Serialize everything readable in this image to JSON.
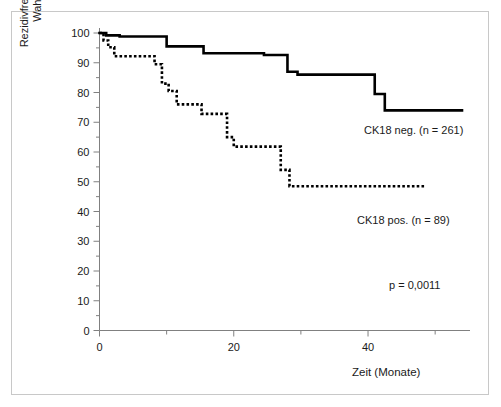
{
  "chart_data": {
    "type": "line",
    "subtype": "kaplan-meier-step",
    "title": "",
    "xlabel": "Zeit (Monate)",
    "ylabel": "Rezidivfreies Gesamtüberleben –\nWahrscheinlichkeit (%)",
    "xlim": [
      0,
      54
    ],
    "ylim": [
      0,
      100
    ],
    "grid": false,
    "legend_position": "inline-annotations",
    "x_ticks_major": [
      0,
      20,
      40
    ],
    "x_tick_labels": [
      "0",
      "20",
      "40"
    ],
    "x_ticks_minor": [
      10,
      30,
      50
    ],
    "y_ticks_major": [
      0,
      10,
      20,
      30,
      40,
      50,
      60,
      70,
      80,
      90,
      100
    ],
    "y_tick_labels": [
      "0",
      "10",
      "20",
      "30",
      "40",
      "50",
      "60",
      "70",
      "80",
      "90",
      "100"
    ],
    "y_ticks_minor": [
      5,
      15,
      25,
      35,
      45,
      55,
      65,
      75,
      85,
      95
    ],
    "series": [
      {
        "name": "CK18 neg.",
        "n": 261,
        "label": "CK18 neg. (n = 261)",
        "style": "solid",
        "color": "#000000",
        "line_width": 2.6,
        "points": [
          [
            0,
            100
          ],
          [
            1,
            100
          ],
          [
            1,
            99.2
          ],
          [
            3,
            99.2
          ],
          [
            3,
            98.8
          ],
          [
            10,
            98.8
          ],
          [
            10,
            95.5
          ],
          [
            15.5,
            95.5
          ],
          [
            15.5,
            93.2
          ],
          [
            24.5,
            93.2
          ],
          [
            24.5,
            92.6
          ],
          [
            28,
            92.6
          ],
          [
            28,
            87.0
          ],
          [
            29.5,
            87.0
          ],
          [
            29.5,
            86.0
          ],
          [
            41,
            86.0
          ],
          [
            41,
            79.5
          ],
          [
            42.5,
            79.5
          ],
          [
            42.5,
            74.0
          ],
          [
            54,
            74.0
          ]
        ]
      },
      {
        "name": "CK18 pos.",
        "n": 89,
        "label": "CK18 pos. (n = 89)",
        "style": "dotted",
        "color": "#000000",
        "line_width": 2.6,
        "points": [
          [
            0,
            100
          ],
          [
            0.6,
            100
          ],
          [
            0.6,
            97.5
          ],
          [
            1.3,
            97.5
          ],
          [
            1.3,
            95.2
          ],
          [
            2.2,
            95.2
          ],
          [
            2.2,
            92.2
          ],
          [
            8.2,
            92.2
          ],
          [
            8.2,
            89.5
          ],
          [
            9.3,
            89.5
          ],
          [
            9.3,
            83.0
          ],
          [
            10.3,
            83.0
          ],
          [
            10.3,
            80.5
          ],
          [
            11.5,
            80.5
          ],
          [
            11.5,
            76.0
          ],
          [
            15.2,
            76.0
          ],
          [
            15.2,
            72.8
          ],
          [
            19.0,
            72.8
          ],
          [
            19.0,
            65.0
          ],
          [
            20.0,
            65.0
          ],
          [
            20.0,
            61.8
          ],
          [
            27.0,
            61.8
          ],
          [
            27.0,
            54.0
          ],
          [
            28.3,
            54.0
          ],
          [
            28.3,
            48.5
          ],
          [
            48.5,
            48.5
          ]
        ]
      }
    ],
    "annotations": [
      {
        "id": "ck18-neg",
        "text": "CK18 neg. (n = 261)"
      },
      {
        "id": "ck18-pos",
        "text": "CK18 pos. (n = 89)"
      },
      {
        "id": "p-value",
        "text": "p = 0,0011"
      }
    ],
    "axis_color": "#808080",
    "frame_color": "#c8c8c8"
  }
}
